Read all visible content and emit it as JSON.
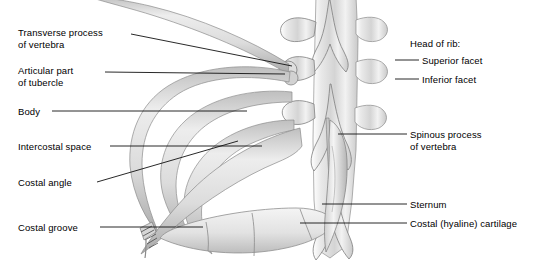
{
  "figure": {
    "background_color": "#ffffff",
    "bone_fill": "#e4e4e4",
    "bone_light": "#f6f6f6",
    "bone_shadow": "#9b9b9b",
    "cartilage_fill": "#ececec",
    "leader_color": "#111111",
    "width": 539,
    "height": 263
  },
  "labels_left": [
    {
      "id": "transverse-process",
      "line1": "Transverse process",
      "line2": "of vertebra",
      "x": 18,
      "y": 32
    },
    {
      "id": "articular-part-of-tubercle",
      "line1": "Articular part",
      "line2": "of tubercle",
      "x": 18,
      "y": 70
    },
    {
      "id": "body",
      "line1": "Body",
      "line2": "",
      "x": 18,
      "y": 108
    },
    {
      "id": "intercostal-space",
      "line1": "Intercostal space",
      "line2": "",
      "x": 18,
      "y": 143
    },
    {
      "id": "costal-angle",
      "line1": "Costal angle",
      "line2": "",
      "x": 18,
      "y": 177
    },
    {
      "id": "costal-groove",
      "line1": "Costal groove",
      "line2": "",
      "x": 18,
      "y": 222
    }
  ],
  "labels_right": [
    {
      "id": "head-of-rib",
      "line1": "Head of rib:",
      "line2": "",
      "x": 410,
      "y": 38
    },
    {
      "id": "superior-facet",
      "line1": "Superior facet",
      "line2": "",
      "x": 422,
      "y": 56
    },
    {
      "id": "inferior-facet",
      "line1": "Inferior facet",
      "line2": "",
      "x": 422,
      "y": 75
    },
    {
      "id": "spinous-process",
      "line1": "Spinous process",
      "line2": "of vertebra",
      "x": 410,
      "y": 130
    },
    {
      "id": "sternum",
      "line1": "Sternum",
      "line2": "",
      "x": 410,
      "y": 200
    },
    {
      "id": "costal-hyaline-cartilage",
      "line1": "Costal (hyaline) cartilage",
      "line2": "",
      "x": 410,
      "y": 219
    }
  ],
  "structures": [
    {
      "id": "vertebral-column",
      "name": "thoracic vertebrae with spinous processes"
    },
    {
      "id": "ribs",
      "name": "ribs 1-4 curving anteriorly"
    },
    {
      "id": "sternum",
      "name": "sternum"
    },
    {
      "id": "costal-cartilage",
      "name": "segmented costal cartilage"
    },
    {
      "id": "cut-rib-end",
      "name": "hatched cut end of rib"
    }
  ]
}
